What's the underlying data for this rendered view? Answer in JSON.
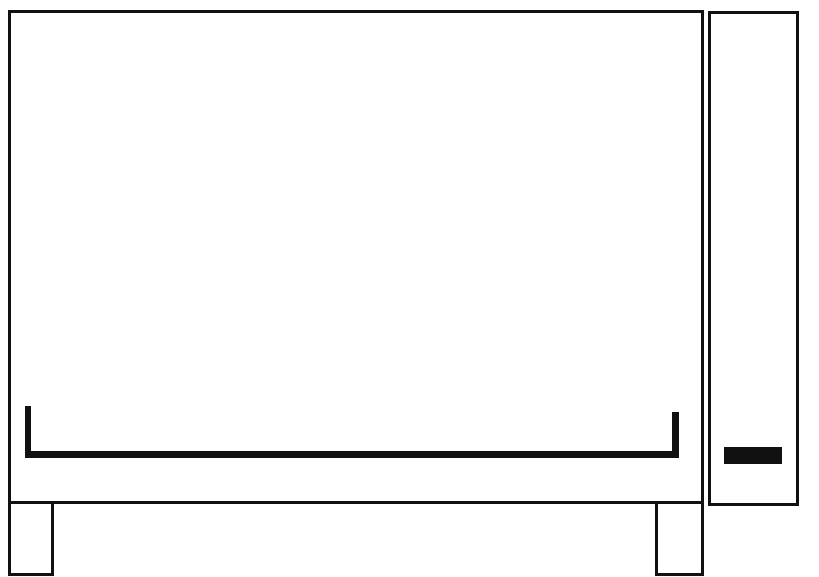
{
  "drawing": {
    "subject": "appliance-line-drawing",
    "stroke_color": "#111111",
    "background_color": "#ffffff",
    "parts": [
      {
        "name": "main-body",
        "x": 8,
        "y": 10,
        "w": 696,
        "h": 494
      },
      {
        "name": "left-leg",
        "x": 8,
        "y": 502,
        "w": 46,
        "h": 74
      },
      {
        "name": "right-leg",
        "x": 655,
        "y": 502,
        "w": 49,
        "h": 74
      },
      {
        "name": "side-panel",
        "x": 708,
        "y": 11,
        "w": 91,
        "h": 495
      },
      {
        "name": "handle-bracket",
        "x": 25,
        "y": 406,
        "w": 654,
        "h": 53
      },
      {
        "name": "panel-button",
        "x": 724,
        "y": 447,
        "w": 58,
        "h": 16
      }
    ]
  }
}
